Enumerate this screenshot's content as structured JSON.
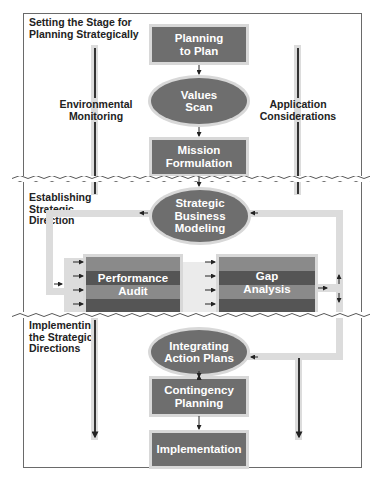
{
  "diagram": {
    "type": "flowchart",
    "colors": {
      "node_fill": "#6e6e6e",
      "node_halo": "#d8d8d8",
      "channel": "#dcdcdc",
      "stripe_light": "#8a8a8a",
      "stripe_dark": "#555555",
      "frame_border": "#6a6a6a",
      "text_dark": "#222222",
      "text_light": "#ffffff"
    },
    "sections": [
      {
        "id": "setting-stage",
        "label": "Setting the Stage for\nPlanning Strategically"
      },
      {
        "id": "establishing-direction",
        "label": "Establishing\nStrategic\nDirection"
      },
      {
        "id": "implementing",
        "label": "Implementing\nthe Strategic\nDirections"
      }
    ],
    "side_labels": {
      "left": "Environmental\nMonitoring",
      "right": "Application\nConsiderations"
    },
    "nodes": [
      {
        "id": "planning-to-plan",
        "shape": "box",
        "label": "Planning\nto Plan"
      },
      {
        "id": "values-scan",
        "shape": "oval",
        "label": "Values\nScan"
      },
      {
        "id": "mission-formulation",
        "shape": "box",
        "label": "Mission\nFormulation"
      },
      {
        "id": "strategic-business-modeling",
        "shape": "oval",
        "label": "Strategic\nBusiness\nModeling"
      },
      {
        "id": "performance-audit",
        "shape": "striped-box",
        "label": "Performance\nAudit"
      },
      {
        "id": "gap-analysis",
        "shape": "striped-box",
        "label": "Gap\nAnalysis"
      },
      {
        "id": "integrating-action-plans",
        "shape": "oval",
        "label": "Integrating\nAction Plans"
      },
      {
        "id": "contingency-planning",
        "shape": "box",
        "label": "Contingency\nPlanning"
      },
      {
        "id": "implementation",
        "shape": "box",
        "label": "Implementation"
      }
    ],
    "edges": [
      {
        "from": "planning-to-plan",
        "to": "values-scan"
      },
      {
        "from": "values-scan",
        "to": "mission-formulation"
      },
      {
        "from": "mission-formulation",
        "to": "strategic-business-modeling"
      },
      {
        "from": "strategic-business-modeling",
        "to": "performance-audit",
        "via": "left loop channel"
      },
      {
        "from": "performance-audit",
        "to": "gap-analysis",
        "count": 4
      },
      {
        "from": "gap-analysis",
        "to": "strategic-business-modeling",
        "via": "right loop channel (up)"
      },
      {
        "from": "gap-analysis",
        "to": "integrating-action-plans",
        "via": "right loop channel (down)"
      },
      {
        "from": "integrating-action-plans",
        "to": "contingency-planning"
      },
      {
        "from": "contingency-planning",
        "to": "implementation"
      }
    ]
  }
}
